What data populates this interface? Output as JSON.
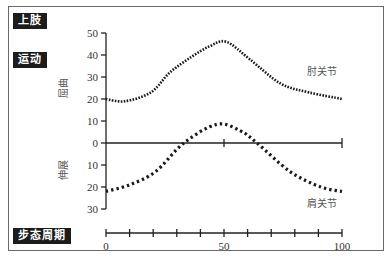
{
  "labels": {
    "limb": "上肢",
    "motion": "运动",
    "gait_cycle": "步态周期",
    "flexion": "屈曲",
    "extension": "伸展",
    "elbow": "肘关节",
    "shoulder": "肩关节"
  },
  "chart_data": {
    "type": "line",
    "xlabel": "步态周期",
    "ylabel_positive": "屈曲",
    "ylabel_negative": "伸展",
    "x_ticks": [
      0,
      50,
      100
    ],
    "x_minor_tick_step": 10,
    "y_ticks": [
      50,
      40,
      30,
      20,
      10,
      0,
      10,
      20,
      30
    ],
    "y_tick_values": [
      50,
      40,
      30,
      20,
      10,
      0,
      -10,
      -20,
      -30
    ],
    "xlim": [
      0,
      100
    ],
    "ylim": [
      -30,
      50
    ],
    "grid": false,
    "line_style": "dotted",
    "series": [
      {
        "name": "肘关节",
        "x": [
          0,
          8,
          19,
          27,
          36,
          44,
          51,
          61,
          74,
          86,
          100
        ],
        "values": [
          20,
          19,
          23,
          32,
          39,
          44,
          46,
          38,
          27,
          23,
          20
        ]
      },
      {
        "name": "肩关节",
        "x": [
          0,
          10,
          21,
          33,
          47,
          57,
          64,
          78,
          91,
          100
        ],
        "values": [
          -22,
          -19,
          -13,
          0,
          8.5,
          5.5,
          0,
          -13,
          -20,
          -22
        ]
      }
    ]
  }
}
